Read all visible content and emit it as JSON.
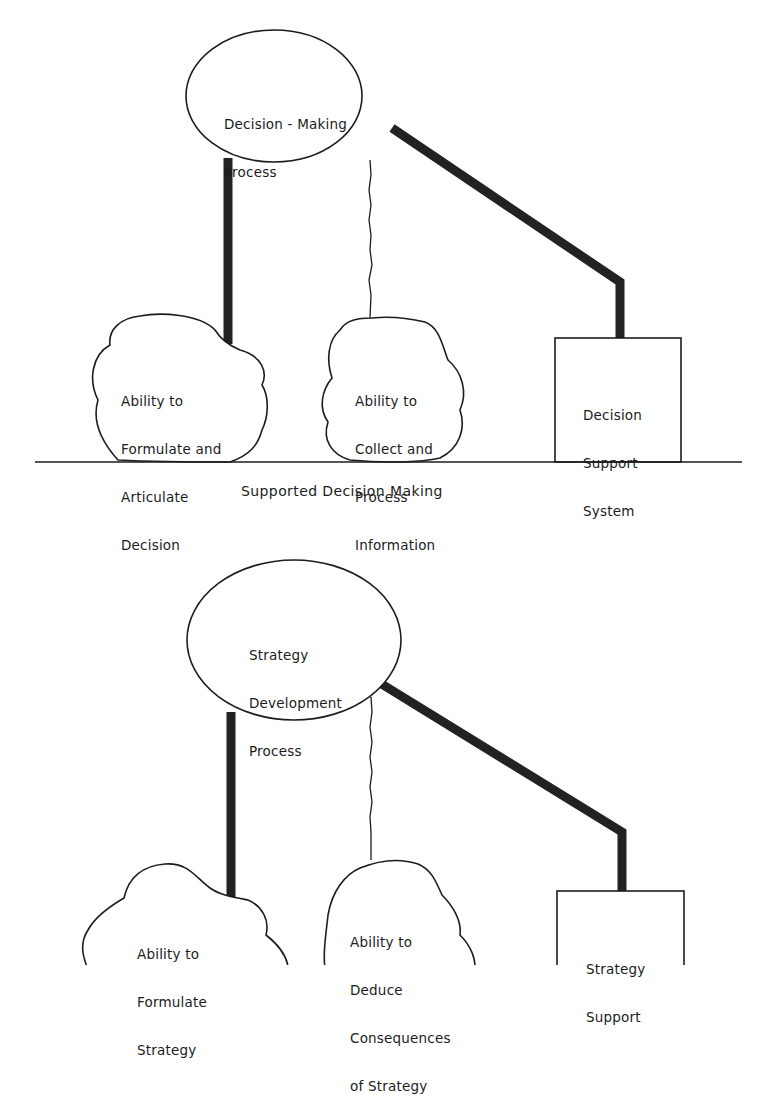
{
  "diagrams": [
    {
      "process": {
        "lines": [
          "Decision - Making",
          "Process"
        ]
      },
      "left_ability": {
        "lines": [
          "Ability to",
          "Formulate and",
          "Articulate",
          "Decision"
        ]
      },
      "middle_ability": {
        "lines": [
          "Ability to",
          "Collect and",
          "Process",
          "Information"
        ]
      },
      "support_system": {
        "lines": [
          "Decision",
          "Support",
          "System"
        ]
      },
      "caption": "Supported Decision Making"
    },
    {
      "process": {
        "lines": [
          "Strategy",
          "Development",
          "Process"
        ]
      },
      "left_ability": {
        "lines": [
          "Ability to",
          "Formulate",
          "Strategy"
        ]
      },
      "middle_ability": {
        "lines": [
          "Ability to",
          "Deduce",
          "Consequences",
          "of Strategy"
        ]
      },
      "support_system": {
        "lines": [
          "Strategy",
          "Support"
        ]
      }
    }
  ],
  "colors": {
    "ink": "#1c1c1c",
    "thick_line": "#222222",
    "background": "#ffffff"
  }
}
